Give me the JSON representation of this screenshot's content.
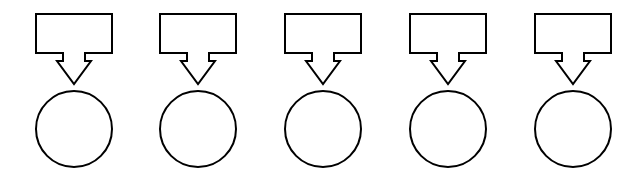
{
  "canvas": {
    "width": 641,
    "height": 180,
    "background_color": "#ffffff",
    "stroke_color": "#000000",
    "fill_color": "#ffffff",
    "stroke_width": 2
  },
  "diagram": {
    "type": "node-sequence",
    "group_count": 5,
    "group_pitch": 124.5,
    "first_group_left": 36,
    "shapes_per_group": [
      {
        "name": "rectangle",
        "label": "",
        "width": 76,
        "height": 39,
        "top": 14
      },
      {
        "name": "arrow",
        "label": "",
        "direction": "down",
        "tip_y": 84,
        "shaft_top": 53,
        "shaft_width": 22,
        "head_width": 34
      },
      {
        "name": "circle",
        "label": "",
        "diameter": 76,
        "center_y": 129
      }
    ],
    "groups": [
      {
        "id": "group-1",
        "x": 36,
        "box_label": "",
        "circle_label": "",
        "arrow_label": ""
      },
      {
        "id": "group-2",
        "x": 160,
        "box_label": "",
        "circle_label": "",
        "arrow_label": ""
      },
      {
        "id": "group-3",
        "x": 285,
        "box_label": "",
        "circle_label": "",
        "arrow_label": ""
      },
      {
        "id": "group-4",
        "x": 410,
        "box_label": "",
        "circle_label": "",
        "arrow_label": ""
      },
      {
        "id": "group-5",
        "x": 535,
        "box_label": "",
        "circle_label": "",
        "arrow_label": ""
      }
    ]
  }
}
